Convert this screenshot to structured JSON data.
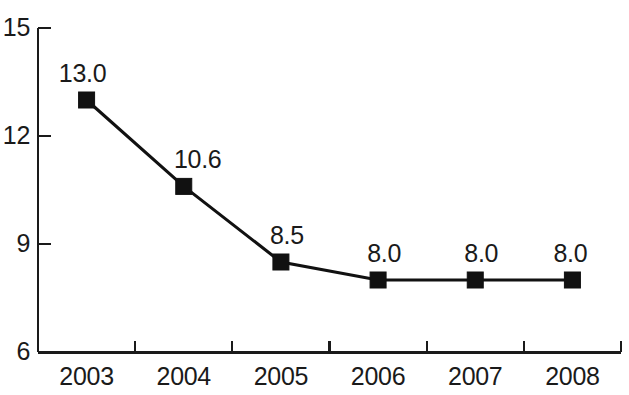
{
  "chart_data": {
    "type": "line",
    "title": "",
    "subtitle": "",
    "xlabel": "",
    "ylabel": "",
    "categories": [
      "2003",
      "2004",
      "2005",
      "2006",
      "2007",
      "2008"
    ],
    "values": [
      13.0,
      10.6,
      8.5,
      8.0,
      8.0,
      8.0
    ],
    "point_labels": [
      "13.0",
      "10.6",
      "8.5",
      "8.0",
      "8.0",
      "8.0"
    ],
    "ylim": [
      6,
      15
    ],
    "yticks": [
      6,
      9,
      12,
      15
    ],
    "ytick_labels": [
      "6",
      "9",
      "12",
      "15"
    ],
    "grid": false,
    "legend": false,
    "legend_position": "none",
    "marker": "square",
    "series": [
      {
        "name": "",
        "values": [
          13.0,
          10.6,
          8.5,
          8.0,
          8.0,
          8.0
        ],
        "color": "#111111"
      }
    ],
    "colors": {
      "line": "#111111",
      "marker": "#111111",
      "axis": "#1a1a1a",
      "text": "#1a1a1a",
      "background": "#ffffff"
    }
  }
}
